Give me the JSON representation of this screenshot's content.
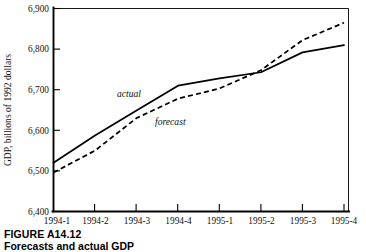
{
  "figure": {
    "caption_title": "FIGURE A14.12",
    "caption_subtitle": "Forecasts and actual GDP"
  },
  "chart_data": {
    "type": "line",
    "title": "",
    "xlabel": "",
    "ylabel": "GDP, billions of 1992 dollars",
    "categories": [
      "1994-1",
      "1994-2",
      "1994-3",
      "1994-4",
      "1995-1",
      "1995-2",
      "1995-3",
      "1995-4"
    ],
    "series": [
      {
        "name": "actual",
        "style": "solid",
        "color": "#000000",
        "values": [
          6520,
          6587,
          6649,
          6710,
          6728,
          6743,
          6792,
          6810
        ]
      },
      {
        "name": "forecast",
        "style": "dashed",
        "color": "#000000",
        "values": [
          6496,
          6550,
          6630,
          6678,
          6703,
          6748,
          6822,
          6865
        ]
      }
    ],
    "ylim": [
      6400,
      6900
    ],
    "ytick_labels": [
      "6,900",
      "6,800",
      "6,700",
      "6,600",
      "6,500",
      "6,400"
    ],
    "ytick_values": [
      6900,
      6800,
      6700,
      6600,
      6500,
      6400
    ],
    "xtick_labels": [
      "1994-1",
      "1994-2",
      "1994-3",
      "1994-4",
      "1995-1",
      "1995-2",
      "1995-3",
      "1995-4"
    ],
    "grid": false,
    "legend": "inline-annotations",
    "annotations": [
      {
        "text": "actual",
        "x_category": "1994-3",
        "value": 6700,
        "style": "italic"
      },
      {
        "text": "forecast",
        "x_category": "1994-4",
        "value": 6625,
        "style": "italic"
      }
    ]
  }
}
